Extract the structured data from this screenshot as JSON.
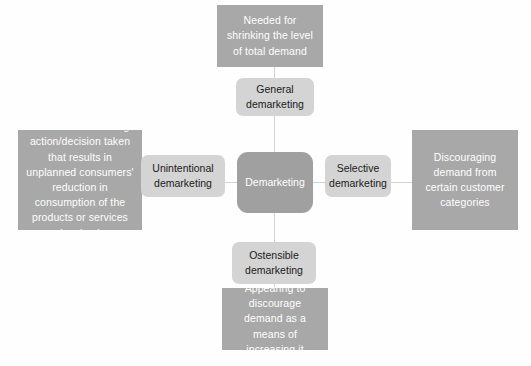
{
  "diagram": {
    "title": "Demarketing",
    "center": {
      "label": "Demarketing"
    },
    "nodes": {
      "general": "General\ndemarketing",
      "unintentional": "Unintentional\ndemarketing",
      "selective": "Selective\ndemarketing",
      "ostensible": "Ostensible\ndemarketing"
    },
    "descriptions": {
      "top": "Needed for shrinking the level of total demand",
      "left": "This is the marketing action/decision taken that results in unplanned consumers' reduction in consumption of the products or services involved",
      "right": "Discouraging demand from certain customer categories",
      "bottom": "Appearing to discourage demand as a means of increasing it"
    },
    "colors": {
      "background": "#fefefe",
      "description_box": "#a8a8a8",
      "description_text": "#ffffff",
      "node_box": "#d4d4d4",
      "node_text": "#1a1a1a",
      "center_box": "#a0a0a0",
      "center_text": "#ffffff",
      "connector": "#d2d2d2"
    }
  }
}
